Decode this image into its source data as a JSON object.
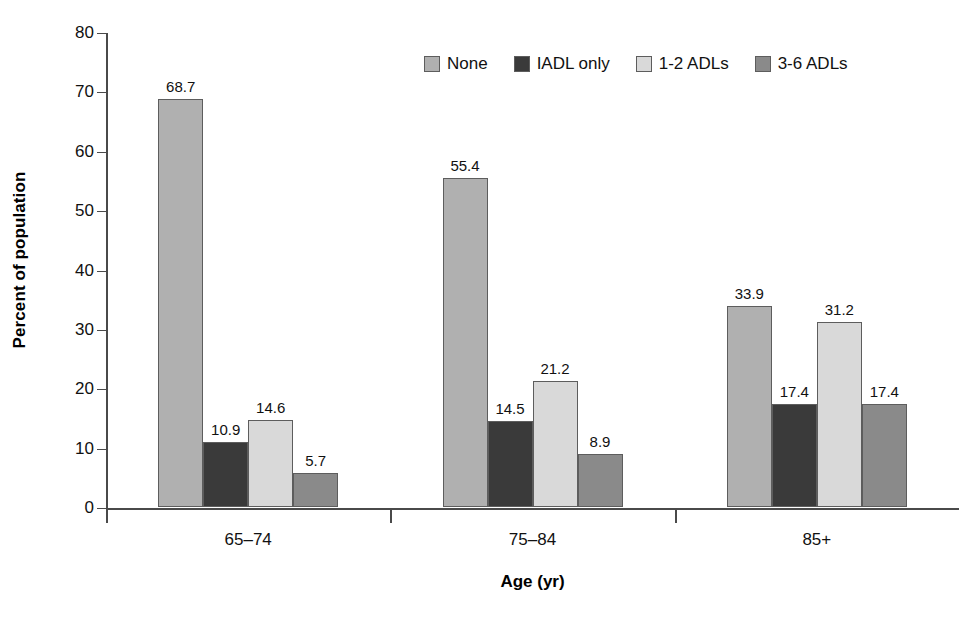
{
  "chart_data": {
    "type": "bar",
    "title": "",
    "xlabel": "Age (yr)",
    "ylabel": "Percent of population",
    "categories": [
      "65–74",
      "75–84",
      "85+"
    ],
    "series": [
      {
        "name": "None",
        "values": [
          68.7,
          55.4,
          33.9
        ],
        "color": "#b0b0b0"
      },
      {
        "name": "IADL only",
        "values": [
          10.9,
          14.5,
          17.4
        ],
        "color": "#3a3a3a"
      },
      {
        "name": "1-2 ADLs",
        "values": [
          14.6,
          21.2,
          31.2
        ],
        "color": "#d9d9d9"
      },
      {
        "name": "3-6 ADLs",
        "values": [
          5.7,
          8.9,
          17.4
        ],
        "color": "#8a8a8a"
      }
    ],
    "value_labels": [
      [
        "68.7",
        "10.9",
        "14.6",
        "5.7"
      ],
      [
        "55.4",
        "14.5",
        "21.2",
        "8.9"
      ],
      [
        "33.9",
        "17.4",
        "31.2",
        "17.4"
      ]
    ],
    "ylim": [
      0,
      80
    ],
    "yticks": [
      0,
      10,
      20,
      30,
      40,
      50,
      60,
      70,
      80
    ],
    "ytick_labels": [
      "0",
      "10",
      "20",
      "30",
      "40",
      "50",
      "60",
      "70",
      "80"
    ],
    "grid": false,
    "legend_position": "top-center"
  },
  "legend": {
    "items": [
      {
        "label": "None",
        "color": "#b0b0b0"
      },
      {
        "label": "IADL only",
        "color": "#3a3a3a"
      },
      {
        "label": "1-2 ADLs",
        "color": "#d9d9d9"
      },
      {
        "label": "3-6 ADLs",
        "color": "#8a8a8a"
      }
    ]
  }
}
